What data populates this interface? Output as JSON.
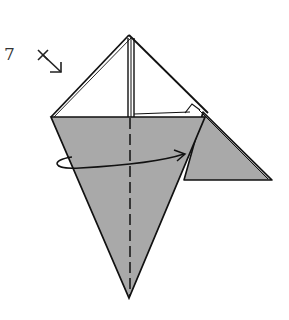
{
  "step": {
    "number": "7",
    "symbol": "turn-over-diagonal-arrow-icon"
  },
  "diagram": {
    "type": "origami-fold-diagram",
    "paper_color": "#a9a9a9",
    "line_color": "#111111",
    "background": "#ffffff",
    "annotations": {
      "valley_fold_line": "dashed vertical center line",
      "fold_arrow": "curved arrow from left edge across to right side"
    }
  }
}
